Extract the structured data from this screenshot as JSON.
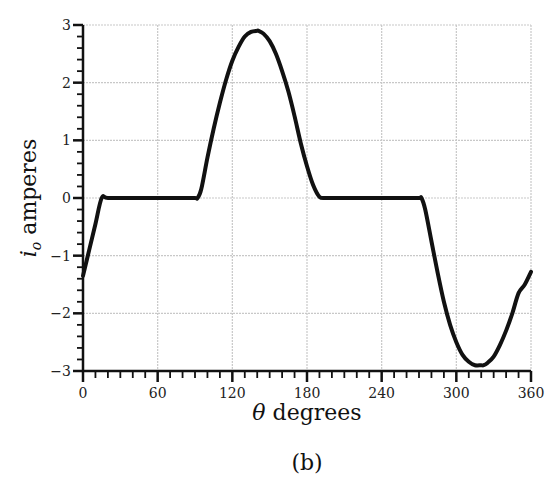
{
  "chart_data": {
    "type": "line",
    "title": "",
    "caption": "(b)",
    "xlabel": "θ degrees",
    "ylabel_main": "i",
    "ylabel_sub": "o",
    "ylabel_rest": " amperes",
    "xlim": [
      0,
      360
    ],
    "ylim": [
      -3,
      3
    ],
    "xticks": [
      0,
      60,
      120,
      180,
      240,
      300,
      360
    ],
    "yticks": [
      -3,
      -2,
      -1,
      0,
      1,
      2,
      3
    ],
    "x_minor_step": 10,
    "y_minor_step": 0.2,
    "grid": true,
    "legend": null,
    "series": [
      {
        "name": "i_o",
        "color": "#111111",
        "x": [
          0,
          5,
          10,
          15,
          20,
          40,
          60,
          80,
          90,
          92,
          95,
          100,
          105,
          110,
          115,
          120,
          125,
          130,
          135,
          140,
          141,
          145,
          150,
          155,
          160,
          165,
          170,
          175,
          180,
          185,
          190,
          195,
          197,
          200,
          220,
          240,
          260,
          270,
          272,
          275,
          280,
          285,
          290,
          295,
          300,
          305,
          310,
          315,
          320,
          322,
          325,
          330,
          335,
          340,
          345,
          350,
          355,
          360
        ],
        "y": [
          -1.35,
          -0.9,
          -0.45,
          0.0,
          0.0,
          0.0,
          0.0,
          0.0,
          0.0,
          0.0,
          0.15,
          0.7,
          1.2,
          1.65,
          2.05,
          2.38,
          2.62,
          2.8,
          2.88,
          2.9,
          2.9,
          2.85,
          2.72,
          2.5,
          2.2,
          1.85,
          1.42,
          0.95,
          0.55,
          0.22,
          0.02,
          0.0,
          0.0,
          0.0,
          0.0,
          0.0,
          0.0,
          0.0,
          0.0,
          -0.2,
          -0.75,
          -1.3,
          -1.8,
          -2.2,
          -2.5,
          -2.72,
          -2.84,
          -2.9,
          -2.9,
          -2.9,
          -2.86,
          -2.75,
          -2.55,
          -2.3,
          -2.0,
          -1.65,
          -1.5,
          -1.28
        ]
      }
    ]
  }
}
